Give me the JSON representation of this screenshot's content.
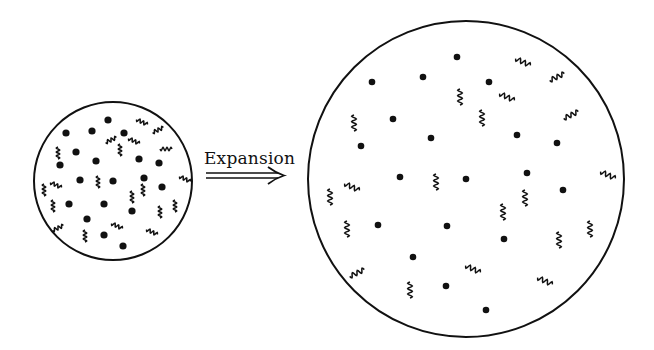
{
  "diagram": {
    "label": "Expansion",
    "small_universe": {
      "center": [
        113,
        181
      ],
      "radius": 79,
      "dots": [
        [
          108,
          120
        ],
        [
          66,
          133
        ],
        [
          92,
          131
        ],
        [
          124,
          133
        ],
        [
          76,
          152
        ],
        [
          96,
          161
        ],
        [
          60,
          165
        ],
        [
          139,
          159
        ],
        [
          159,
          163
        ],
        [
          80,
          180
        ],
        [
          113,
          181
        ],
        [
          144,
          178
        ],
        [
          162,
          187
        ],
        [
          69,
          204
        ],
        [
          104,
          204
        ],
        [
          132,
          211
        ],
        [
          87,
          219
        ],
        [
          104,
          235
        ],
        [
          123,
          246
        ]
      ],
      "waves": [
        [
          142,
          122,
          "d"
        ],
        [
          158,
          130,
          "u"
        ],
        [
          111,
          140,
          "u"
        ],
        [
          134,
          141,
          "d"
        ],
        [
          166,
          149,
          "h"
        ],
        [
          58,
          153,
          "v"
        ],
        [
          120,
          150,
          "v"
        ],
        [
          185,
          179,
          "d"
        ],
        [
          98,
          182,
          "v"
        ],
        [
          56,
          185,
          "d"
        ],
        [
          44,
          190,
          "v"
        ],
        [
          132,
          197,
          "v"
        ],
        [
          143,
          190,
          "v"
        ],
        [
          53,
          206,
          "v"
        ],
        [
          160,
          212,
          "v"
        ],
        [
          175,
          206,
          "v"
        ],
        [
          58,
          228,
          "u"
        ],
        [
          117,
          226,
          "d"
        ],
        [
          152,
          232,
          "d"
        ],
        [
          85,
          236,
          "v"
        ]
      ]
    },
    "large_universe": {
      "center": [
        466,
        179
      ],
      "radius": 158,
      "dots": [
        [
          457,
          57
        ],
        [
          372,
          82
        ],
        [
          423,
          77
        ],
        [
          489,
          82
        ],
        [
          393,
          119
        ],
        [
          431,
          138
        ],
        [
          517,
          135
        ],
        [
          557,
          143
        ],
        [
          361,
          146
        ],
        [
          400,
          177
        ],
        [
          466,
          179
        ],
        [
          527,
          173
        ],
        [
          563,
          190
        ],
        [
          378,
          225
        ],
        [
          447,
          226
        ],
        [
          504,
          239
        ],
        [
          413,
          257
        ],
        [
          446,
          286
        ],
        [
          486,
          310
        ]
      ],
      "waves": [
        [
          523,
          62,
          "d"
        ],
        [
          557,
          77,
          "u"
        ],
        [
          460,
          97,
          "v"
        ],
        [
          482,
          118,
          "v"
        ],
        [
          507,
          97,
          "d"
        ],
        [
          571,
          115,
          "u"
        ],
        [
          354,
          123,
          "v"
        ],
        [
          436,
          182,
          "v"
        ],
        [
          352,
          187,
          "d"
        ],
        [
          330,
          197,
          "v"
        ],
        [
          608,
          175,
          "d"
        ],
        [
          525,
          198,
          "v"
        ],
        [
          503,
          212,
          "v"
        ],
        [
          347,
          229,
          "v"
        ],
        [
          590,
          229,
          "v"
        ],
        [
          559,
          240,
          "v"
        ],
        [
          357,
          273,
          "u"
        ],
        [
          473,
          269,
          "d"
        ],
        [
          545,
          281,
          "d"
        ],
        [
          410,
          290,
          "v"
        ]
      ]
    },
    "colors": {
      "ink": "#111111",
      "background": "#ffffff"
    }
  }
}
